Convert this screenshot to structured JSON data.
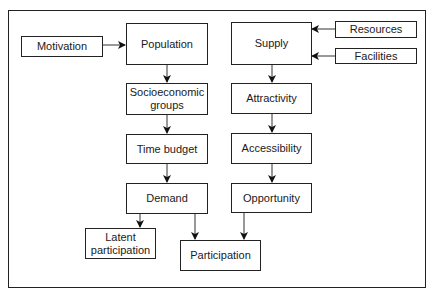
{
  "nodes": {
    "motivation": "Motivation",
    "population": "Population",
    "socioeconomic": "Socioeconomic groups",
    "time_budget": "Time budget",
    "demand": "Demand",
    "latent": "Latent participation",
    "participation": "Participation",
    "supply": "Supply",
    "resources": "Resources",
    "facilities": "Facilities",
    "attractivity": "Attractivity",
    "accessibility": "Accessibility",
    "opportunity": "Opportunity"
  },
  "edges": [
    [
      "Motivation",
      "Population"
    ],
    [
      "Population",
      "Socioeconomic groups"
    ],
    [
      "Socioeconomic groups",
      "Time budget"
    ],
    [
      "Time budget",
      "Demand"
    ],
    [
      "Demand",
      "Latent participation"
    ],
    [
      "Demand",
      "Participation"
    ],
    [
      "Resources",
      "Supply"
    ],
    [
      "Facilities",
      "Supply"
    ],
    [
      "Supply",
      "Attractivity"
    ],
    [
      "Attractivity",
      "Accessibility"
    ],
    [
      "Accessibility",
      "Opportunity"
    ],
    [
      "Opportunity",
      "Participation"
    ]
  ]
}
